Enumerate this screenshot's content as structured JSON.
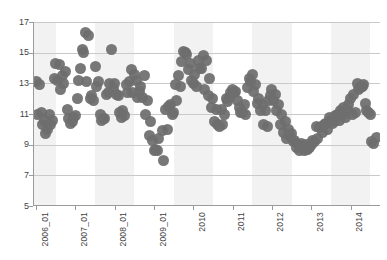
{
  "chart_data": {
    "type": "scatter",
    "title": "",
    "subtitle": "",
    "xlabel": "",
    "ylabel": "",
    "xlim": [
      2005.92,
      2014.75
    ],
    "ylim": [
      5,
      17
    ],
    "grid": true,
    "legend": false,
    "legend_position": "none",
    "marker": {
      "shape": "circle",
      "color": "#6e6e6e",
      "size_px": 11
    },
    "background": {
      "plot_bg": "#ffffff",
      "band_color": "#f2f2f2",
      "band_note": "alternating vertical year bands",
      "gridline_color": "#c9c9c9",
      "axis_color": "#9a9a9a"
    },
    "y_ticks": [
      5,
      7,
      9,
      11,
      13,
      15,
      17
    ],
    "y_tick_labels": [
      "5",
      "7",
      "9",
      "11",
      "13",
      "15",
      "17"
    ],
    "x_ticks": [
      2006.0,
      2007.0,
      2008.0,
      2009.0,
      2010.0,
      2011.0,
      2012.0,
      2013.0,
      2014.0
    ],
    "x_tick_labels": [
      "2006_01",
      "2007_01",
      "2008_01",
      "2009_01",
      "2010",
      "2011",
      "2012",
      "2013",
      "2014"
    ],
    "series": [
      {
        "name": "value",
        "points": [
          [
            2006.0,
            13.1
          ],
          [
            2006.083,
            12.9
          ],
          [
            2006.167,
            10.3
          ],
          [
            2006.25,
            9.7
          ],
          [
            2006.333,
            11.0
          ],
          [
            2006.417,
            10.6
          ],
          [
            2006.5,
            14.3
          ],
          [
            2006.583,
            14.2
          ],
          [
            2006.667,
            13.5
          ],
          [
            2006.75,
            13.8
          ],
          [
            2006.833,
            10.7
          ],
          [
            2006.917,
            10.5
          ],
          [
            2007.0,
            10.9
          ],
          [
            2007.083,
            13.2
          ],
          [
            2007.167,
            15.2
          ],
          [
            2007.25,
            16.3
          ],
          [
            2007.333,
            16.1
          ],
          [
            2007.417,
            12.2
          ],
          [
            2007.5,
            14.1
          ],
          [
            2007.583,
            13.1
          ],
          [
            2007.667,
            10.6
          ],
          [
            2007.75,
            10.7
          ],
          [
            2007.833,
            12.4
          ],
          [
            2007.917,
            15.2
          ],
          [
            2008.0,
            13.0
          ],
          [
            2008.083,
            12.2
          ],
          [
            2008.167,
            10.8
          ],
          [
            2008.25,
            10.9
          ],
          [
            2008.333,
            12.4
          ],
          [
            2008.417,
            13.9
          ],
          [
            2008.5,
            13.6
          ],
          [
            2008.583,
            12.1
          ],
          [
            2008.667,
            12.8
          ],
          [
            2008.75,
            13.5
          ],
          [
            2008.833,
            11.9
          ],
          [
            2008.917,
            10.5
          ],
          [
            2009.0,
            8.6
          ],
          [
            2009.083,
            8.6
          ],
          [
            2009.25,
            8.0
          ],
          [
            2009.333,
            10.0
          ],
          [
            2009.417,
            11.6
          ],
          [
            2009.5,
            11.1
          ],
          [
            2009.583,
            11.9
          ],
          [
            2009.667,
            12.8
          ],
          [
            2009.75,
            15.1
          ],
          [
            2009.833,
            14.9
          ],
          [
            2009.917,
            14.3
          ],
          [
            2010.0,
            13.0
          ],
          [
            2010.083,
            12.8
          ],
          [
            2010.167,
            14.0
          ],
          [
            2010.25,
            14.8
          ],
          [
            2010.333,
            14.5
          ],
          [
            2010.417,
            13.3
          ],
          [
            2010.5,
            12.0
          ],
          [
            2010.583,
            11.3
          ],
          [
            2010.667,
            10.2
          ],
          [
            2010.75,
            10.3
          ],
          [
            2010.833,
            12.0
          ],
          [
            2010.917,
            12.1
          ],
          [
            2011.0,
            12.6
          ],
          [
            2011.083,
            12.5
          ],
          [
            2011.167,
            11.4
          ],
          [
            2011.25,
            11.1
          ],
          [
            2011.333,
            11.0
          ],
          [
            2011.417,
            13.3
          ],
          [
            2011.5,
            13.6
          ],
          [
            2011.583,
            12.9
          ],
          [
            2011.667,
            12.0
          ],
          [
            2011.75,
            11.6
          ],
          [
            2011.833,
            11.2
          ],
          [
            2011.917,
            11.9
          ],
          [
            2012.0,
            12.6
          ],
          [
            2012.083,
            12.3
          ],
          [
            2012.167,
            11.6
          ],
          [
            2012.25,
            11.0
          ],
          [
            2012.333,
            10.5
          ],
          [
            2012.417,
            10.0
          ],
          [
            2012.5,
            9.7
          ],
          [
            2012.583,
            9.3
          ],
          [
            2012.667,
            9.0
          ],
          [
            2012.75,
            9.1
          ],
          [
            2012.833,
            8.6
          ],
          [
            2012.917,
            8.7
          ],
          [
            2013.0,
            9.0
          ],
          [
            2013.083,
            9.2
          ],
          [
            2013.167,
            9.4
          ],
          [
            2013.25,
            10.2
          ],
          [
            2013.333,
            10.3
          ],
          [
            2013.417,
            10.0
          ],
          [
            2013.5,
            10.6
          ],
          [
            2013.583,
            10.5
          ],
          [
            2013.667,
            11.0
          ],
          [
            2013.75,
            11.2
          ],
          [
            2013.833,
            11.4
          ],
          [
            2013.917,
            11.3
          ],
          [
            2014.0,
            12.0
          ],
          [
            2014.083,
            12.3
          ],
          [
            2014.167,
            13.0
          ],
          [
            2014.25,
            12.7
          ],
          [
            2014.333,
            12.9
          ],
          [
            2014.417,
            11.2
          ],
          [
            2014.5,
            11.0
          ],
          [
            2014.583,
            9.1
          ],
          [
            2014.667,
            9.5
          ]
        ]
      },
      {
        "name": "value-secondary",
        "points": [
          [
            2006.042,
            11.0
          ],
          [
            2006.125,
            11.1
          ],
          [
            2006.208,
            10.6
          ],
          [
            2006.292,
            10.0
          ],
          [
            2006.375,
            10.3
          ],
          [
            2006.458,
            13.3
          ],
          [
            2006.542,
            13.2
          ],
          [
            2006.625,
            12.6
          ],
          [
            2006.708,
            13.0
          ],
          [
            2006.792,
            11.3
          ],
          [
            2006.875,
            10.4
          ],
          [
            2006.958,
            10.8
          ],
          [
            2007.042,
            12.0
          ],
          [
            2007.125,
            14.0
          ],
          [
            2007.208,
            15.0
          ],
          [
            2007.292,
            13.1
          ],
          [
            2007.375,
            12.0
          ],
          [
            2007.458,
            11.9
          ],
          [
            2007.542,
            12.8
          ],
          [
            2007.625,
            11.0
          ],
          [
            2007.708,
            10.7
          ],
          [
            2007.792,
            12.3
          ],
          [
            2007.875,
            13.0
          ],
          [
            2007.958,
            12.6
          ],
          [
            2008.042,
            12.3
          ],
          [
            2008.125,
            11.1
          ],
          [
            2008.208,
            11.2
          ],
          [
            2008.292,
            12.9
          ],
          [
            2008.375,
            13.1
          ],
          [
            2008.458,
            12.4
          ],
          [
            2008.542,
            13.2
          ],
          [
            2008.625,
            12.5
          ],
          [
            2008.708,
            12.1
          ],
          [
            2008.792,
            11.0
          ],
          [
            2008.875,
            9.6
          ],
          [
            2008.958,
            9.3
          ],
          [
            2009.042,
            8.7
          ],
          [
            2009.125,
            9.4
          ],
          [
            2009.208,
            9.9
          ],
          [
            2009.292,
            11.3
          ],
          [
            2009.375,
            11.5
          ],
          [
            2009.458,
            11.0
          ],
          [
            2009.542,
            12.9
          ],
          [
            2009.625,
            13.5
          ],
          [
            2009.708,
            14.4
          ],
          [
            2009.792,
            15.0
          ],
          [
            2009.875,
            13.9
          ],
          [
            2009.958,
            13.2
          ],
          [
            2010.042,
            13.6
          ],
          [
            2010.125,
            14.5
          ],
          [
            2010.208,
            14.0
          ],
          [
            2010.292,
            12.6
          ],
          [
            2010.375,
            12.2
          ],
          [
            2010.458,
            11.4
          ],
          [
            2010.542,
            10.5
          ],
          [
            2010.625,
            10.3
          ],
          [
            2010.708,
            11.3
          ],
          [
            2010.792,
            11.0
          ],
          [
            2010.875,
            11.8
          ],
          [
            2010.958,
            12.4
          ],
          [
            2011.042,
            12.4
          ],
          [
            2011.125,
            11.9
          ],
          [
            2011.208,
            11.1
          ],
          [
            2011.292,
            11.6
          ],
          [
            2011.375,
            12.7
          ],
          [
            2011.458,
            13.1
          ],
          [
            2011.542,
            12.5
          ],
          [
            2011.625,
            11.7
          ],
          [
            2011.708,
            11.2
          ],
          [
            2011.792,
            10.3
          ],
          [
            2011.875,
            10.2
          ],
          [
            2011.958,
            12.2
          ],
          [
            2012.042,
            11.9
          ],
          [
            2012.125,
            11.2
          ],
          [
            2012.208,
            10.3
          ],
          [
            2012.292,
            9.8
          ],
          [
            2012.375,
            9.4
          ],
          [
            2012.458,
            9.6
          ],
          [
            2012.542,
            9.2
          ],
          [
            2012.625,
            8.8
          ],
          [
            2012.708,
            8.6
          ],
          [
            2012.792,
            8.9
          ],
          [
            2012.875,
            9.0
          ],
          [
            2012.958,
            8.8
          ],
          [
            2013.042,
            9.3
          ],
          [
            2013.125,
            10.2
          ],
          [
            2013.208,
            10.1
          ],
          [
            2013.292,
            9.8
          ],
          [
            2013.375,
            10.4
          ],
          [
            2013.458,
            10.8
          ],
          [
            2013.542,
            10.4
          ],
          [
            2013.625,
            10.9
          ],
          [
            2013.708,
            10.6
          ],
          [
            2013.792,
            11.0
          ],
          [
            2013.875,
            10.8
          ],
          [
            2013.958,
            11.6
          ],
          [
            2014.042,
            11.0
          ],
          [
            2014.125,
            11.1
          ],
          [
            2014.208,
            12.6
          ],
          [
            2014.292,
            12.8
          ],
          [
            2014.375,
            11.7
          ],
          [
            2014.458,
            11.1
          ],
          [
            2014.542,
            9.2
          ]
        ]
      }
    ]
  }
}
